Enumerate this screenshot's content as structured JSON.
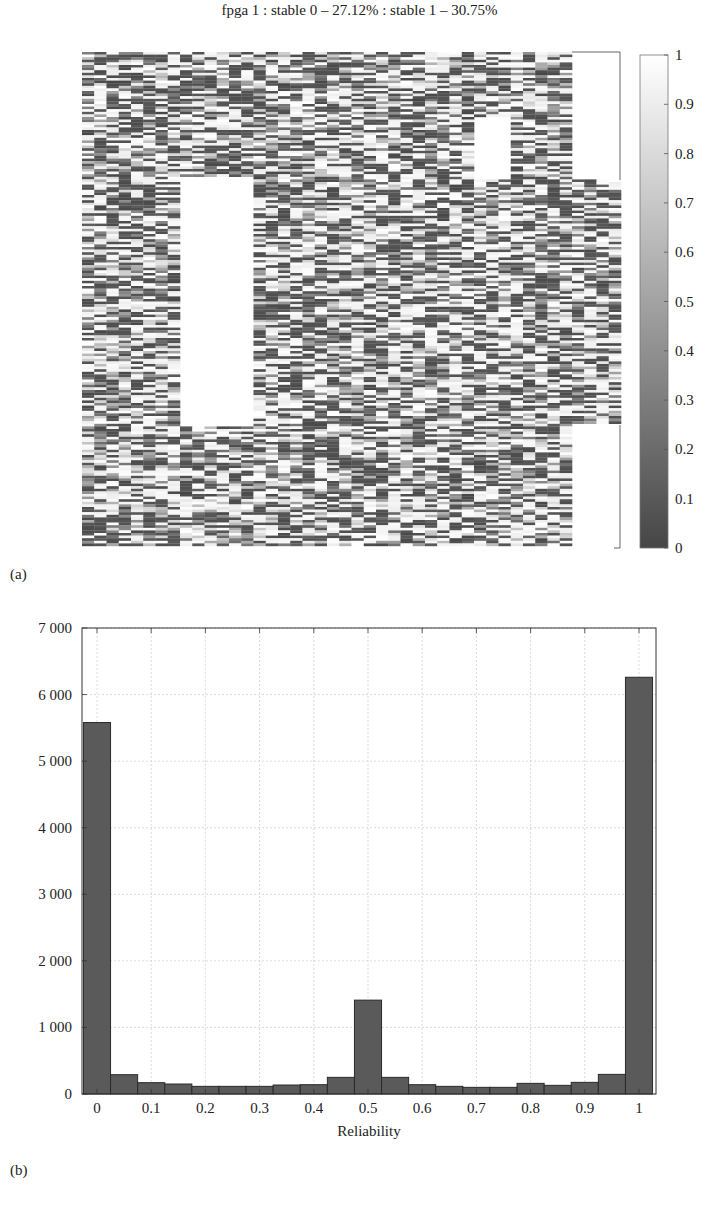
{
  "figure": {
    "panel_a_label": "(a)",
    "panel_b_label": "(b)"
  },
  "chart_data": [
    {
      "type": "heatmap",
      "title": "fpga 1 : stable 0 – 27.12% : stable 1 – 30.75%",
      "stats": {
        "stable_0_percent": 27.12,
        "stable_1_percent": 30.75
      },
      "colormap": "grayscale (0 = dark, 1 = white)",
      "colorbar": {
        "range": [
          0,
          1
        ],
        "ticks": [
          "0",
          "0.1",
          "0.2",
          "0.3",
          "0.4",
          "0.5",
          "0.6",
          "0.7",
          "0.8",
          "0.9",
          "1"
        ]
      },
      "note": "per-cell reliability values of the FPGA memory map; empty (white) regions are unused blocks"
    },
    {
      "type": "bar",
      "title": "",
      "xlabel": "Reliability",
      "ylabel": "",
      "xlim": [
        0,
        1
      ],
      "ylim": [
        0,
        7000
      ],
      "grid": true,
      "bin_width": 0.05,
      "x_ticks": [
        "0",
        "0.1",
        "0.2",
        "0.3",
        "0.4",
        "0.5",
        "0.6",
        "0.7",
        "0.8",
        "0.9",
        "1"
      ],
      "y_ticks": [
        "0",
        "1 000",
        "2 000",
        "3 000",
        "4 000",
        "5 000",
        "6 000",
        "7 000"
      ],
      "categories": [
        "0.025",
        "0.075",
        "0.125",
        "0.175",
        "0.225",
        "0.275",
        "0.325",
        "0.375",
        "0.425",
        "0.475",
        "0.525",
        "0.575",
        "0.625",
        "0.675",
        "0.725",
        "0.775",
        "0.825",
        "0.875",
        "0.925",
        "0.975"
      ],
      "values": [
        5580,
        290,
        170,
        150,
        115,
        115,
        115,
        135,
        140,
        250,
        1410,
        250,
        140,
        115,
        100,
        100,
        160,
        130,
        175,
        295,
        6260
      ],
      "bar_centers": [
        0.0,
        0.05,
        0.1,
        0.15,
        0.2,
        0.25,
        0.3,
        0.35,
        0.4,
        0.45,
        0.5,
        0.55,
        0.6,
        0.65,
        0.7,
        0.75,
        0.8,
        0.85,
        0.9,
        0.95,
        1.0
      ]
    }
  ]
}
